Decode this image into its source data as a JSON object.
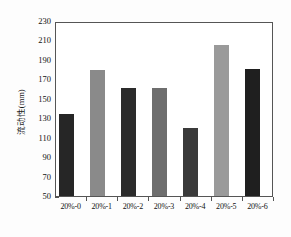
{
  "chart_data": {
    "type": "bar",
    "title": "",
    "xlabel": "",
    "ylabel": "流动性(mm)",
    "categories": [
      "20%-0",
      "20%-1",
      "20%-2",
      "20%-3",
      "20%-4",
      "20%-5",
      "20%-6"
    ],
    "values": [
      134,
      180,
      161,
      161,
      120,
      205,
      181
    ],
    "bar_colors": [
      "#262626",
      "#8a8a8a",
      "#2b2b2b",
      "#6e6e6e",
      "#3a3a3a",
      "#9a9a9a",
      "#1f1f1f"
    ],
    "ylim": [
      50,
      230
    ],
    "ytick_labels": [
      "230",
      "210",
      "190",
      "170",
      "150",
      "130",
      "110",
      "90",
      "70",
      "50"
    ],
    "ytick_values": [
      230,
      210,
      190,
      170,
      150,
      130,
      110,
      90,
      70,
      50
    ],
    "grid": false,
    "legend": null,
    "axis_color": "#555555",
    "background": "#ffffff"
  }
}
